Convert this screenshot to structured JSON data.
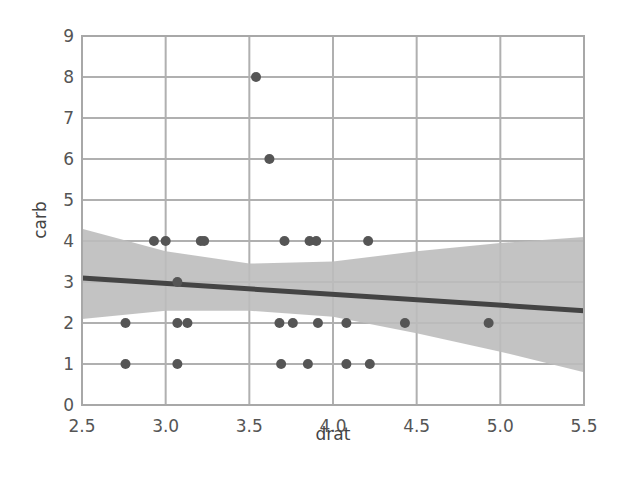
{
  "chart_data": {
    "type": "scatter",
    "title": "",
    "xlabel": "drat",
    "ylabel": "carb",
    "xlim": [
      2.5,
      5.5
    ],
    "ylim": [
      0,
      9
    ],
    "x_ticks": [
      "2.5",
      "3.0",
      "3.5",
      "4.0",
      "4.5",
      "5.0",
      "5.5"
    ],
    "y_ticks": [
      "0",
      "1",
      "2",
      "3",
      "4",
      "5",
      "6",
      "7",
      "8",
      "9"
    ],
    "grid": true,
    "legend": null,
    "points": [
      {
        "x": 2.93,
        "y": 4
      },
      {
        "x": 3.0,
        "y": 4
      },
      {
        "x": 3.21,
        "y": 4
      },
      {
        "x": 3.23,
        "y": 4
      },
      {
        "x": 3.71,
        "y": 4
      },
      {
        "x": 3.86,
        "y": 4
      },
      {
        "x": 3.9,
        "y": 4
      },
      {
        "x": 4.21,
        "y": 4
      },
      {
        "x": 3.07,
        "y": 3
      },
      {
        "x": 2.76,
        "y": 2
      },
      {
        "x": 3.07,
        "y": 2
      },
      {
        "x": 3.13,
        "y": 2
      },
      {
        "x": 3.68,
        "y": 2
      },
      {
        "x": 3.76,
        "y": 2
      },
      {
        "x": 3.91,
        "y": 2
      },
      {
        "x": 4.08,
        "y": 2
      },
      {
        "x": 4.43,
        "y": 2
      },
      {
        "x": 4.93,
        "y": 2
      },
      {
        "x": 2.76,
        "y": 1
      },
      {
        "x": 3.07,
        "y": 1
      },
      {
        "x": 3.69,
        "y": 1
      },
      {
        "x": 3.85,
        "y": 1
      },
      {
        "x": 4.08,
        "y": 1
      },
      {
        "x": 4.22,
        "y": 1
      },
      {
        "x": 3.62,
        "y": 6
      },
      {
        "x": 3.54,
        "y": 8
      }
    ],
    "regression": {
      "type": "linear",
      "line": [
        {
          "x": 2.5,
          "y": 3.1
        },
        {
          "x": 5.5,
          "y": 2.3
        }
      ],
      "confidence_band": {
        "x": [
          2.5,
          3.0,
          3.5,
          4.0,
          4.5,
          5.0,
          5.5
        ],
        "lower": [
          2.1,
          2.3,
          2.3,
          2.15,
          1.75,
          1.3,
          0.8
        ],
        "upper": [
          4.3,
          3.75,
          3.45,
          3.5,
          3.75,
          3.95,
          4.1
        ]
      }
    },
    "colors": {
      "points": "#555555",
      "line": "#444444",
      "band": "#bdbdbd",
      "grid": "#b0b0b0"
    }
  }
}
